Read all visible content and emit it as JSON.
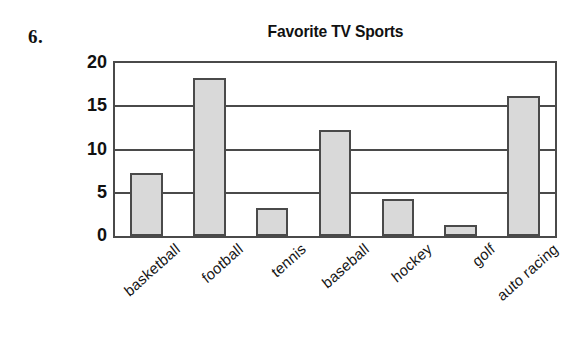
{
  "problem": {
    "number": "6."
  },
  "chart_data": {
    "type": "bar",
    "title": "Favorite TV Sports",
    "xlabel": "",
    "ylabel": "",
    "categories": [
      "basketball",
      "football",
      "tennis",
      "baseball",
      "hockey",
      "golf",
      "auto racing"
    ],
    "values": [
      7,
      18,
      3,
      12,
      4,
      1,
      16
    ],
    "ylim": [
      0,
      20
    ],
    "yticks": [
      0,
      5,
      10,
      15,
      20
    ],
    "ytick_labels": [
      "0",
      "5",
      "10",
      "15",
      "20"
    ],
    "grid": true,
    "grid_axis": "y",
    "legend": false,
    "bar_fill_color": "#d9d9d9",
    "bar_border_color": "#4a4a4a",
    "axis_color": "#4a4a4a",
    "background_color": "#ffffff",
    "tick_label_rotation": -42
  }
}
